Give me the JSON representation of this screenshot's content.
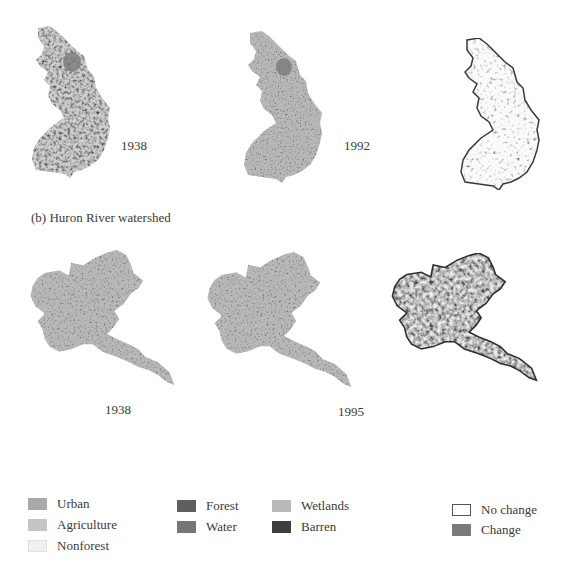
{
  "panel_a": {
    "maps": [
      {
        "label": "1938",
        "type": "landcover"
      },
      {
        "label": "1992",
        "type": "landcover"
      },
      {
        "label": "",
        "type": "change"
      }
    ]
  },
  "panel_b": {
    "title": "(b) Huron River watershed",
    "maps": [
      {
        "label": "1938",
        "type": "landcover"
      },
      {
        "label": "1995",
        "type": "landcover"
      },
      {
        "label": "",
        "type": "change"
      }
    ]
  },
  "legend": {
    "landcover": [
      {
        "label": "Urban",
        "color": "#a9a9a9"
      },
      {
        "label": "Agriculture",
        "color": "#c4c4c4"
      },
      {
        "label": "Nonforest",
        "color": "#f0f0f0"
      },
      {
        "label": "Forest",
        "color": "#5f5f5f"
      },
      {
        "label": "Water",
        "color": "#767676"
      },
      {
        "label": "Wetlands",
        "color": "#b9b9b9"
      },
      {
        "label": "Barren",
        "color": "#3e3e3e"
      }
    ],
    "change": [
      {
        "label": "No change",
        "color": "#ffffff"
      },
      {
        "label": "Change",
        "color": "#7a7a7a"
      }
    ]
  }
}
